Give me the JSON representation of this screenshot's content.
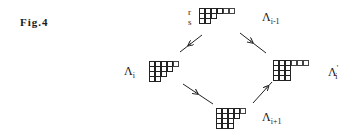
{
  "figure": {
    "label": "Fig.4"
  },
  "row_labels": [
    "r",
    "s"
  ],
  "nodes": {
    "top": {
      "label": "Λ",
      "sub": "i-1",
      "prime": "",
      "rows": [
        [
          4,
          2
        ],
        [
          3,
          0
        ],
        [
          2,
          0
        ]
      ]
    },
    "left": {
      "label": "Λ",
      "sub": "i",
      "prime": "",
      "rows": [
        [
          4,
          1
        ],
        [
          4,
          0
        ],
        [
          3,
          0
        ],
        [
          2,
          0
        ]
      ]
    },
    "right": {
      "label": "Λ",
      "sub": "i",
      "prime": "'",
      "rows": [
        [
          3,
          3
        ],
        [
          3,
          0
        ],
        [
          3,
          0
        ],
        [
          3,
          0
        ]
      ]
    },
    "bottom": {
      "label": "Λ",
      "sub": "i+1",
      "prime": "",
      "rows": [
        [
          4,
          1
        ],
        [
          4,
          0
        ],
        [
          3,
          0
        ],
        [
          3,
          0
        ]
      ]
    }
  },
  "arrows": [
    {
      "from": "top",
      "to": "left"
    },
    {
      "from": "top",
      "to": "right"
    },
    {
      "from": "left",
      "to": "bottom"
    },
    {
      "from": "right",
      "to": "bottom"
    }
  ]
}
